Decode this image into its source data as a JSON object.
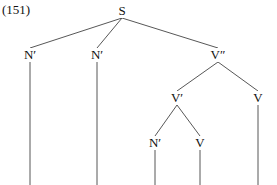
{
  "figure": {
    "example_number": "(151)",
    "width": 277,
    "height": 185,
    "background_color": "#ffffff",
    "line_color": "#444444",
    "text_color": "#111111"
  },
  "tree": {
    "type": "syntax-tree",
    "nodes": [
      {
        "id": "s",
        "label": "S",
        "x": 122,
        "y": 11,
        "level": 0
      },
      {
        "id": "n1",
        "label": "N′",
        "x": 30,
        "y": 55,
        "level": 1
      },
      {
        "id": "n2",
        "label": "N′",
        "x": 97,
        "y": 55,
        "level": 1
      },
      {
        "id": "vbar2",
        "label": "V″",
        "x": 218,
        "y": 55,
        "level": 1
      },
      {
        "id": "vbar1",
        "label": "V′",
        "x": 177,
        "y": 98,
        "level": 2
      },
      {
        "id": "v1",
        "label": "V",
        "x": 258,
        "y": 98,
        "level": 2
      },
      {
        "id": "n3",
        "label": "N′",
        "x": 155,
        "y": 143,
        "level": 3
      },
      {
        "id": "v2",
        "label": "V",
        "x": 200,
        "y": 143,
        "level": 3
      }
    ],
    "edges": [
      {
        "from": "s",
        "to": "n1"
      },
      {
        "from": "s",
        "to": "n2"
      },
      {
        "from": "s",
        "to": "vbar2"
      },
      {
        "from": "vbar2",
        "to": "vbar1"
      },
      {
        "from": "vbar2",
        "to": "v1"
      },
      {
        "from": "vbar1",
        "to": "n3"
      },
      {
        "from": "vbar1",
        "to": "v2"
      }
    ],
    "terminal_stems": [
      {
        "id": "stem-n1",
        "x": 30,
        "from_y": 62,
        "to_y": 185
      },
      {
        "id": "stem-n2",
        "x": 97,
        "from_y": 62,
        "to_y": 185
      },
      {
        "id": "stem-n3",
        "x": 155,
        "from_y": 150,
        "to_y": 185
      },
      {
        "id": "stem-v2",
        "x": 200,
        "from_y": 150,
        "to_y": 185
      },
      {
        "id": "stem-v1",
        "x": 258,
        "from_y": 105,
        "to_y": 185
      }
    ]
  }
}
